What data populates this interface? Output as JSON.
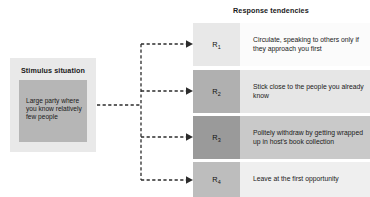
{
  "stimulus": {
    "title": "Stimulus situation",
    "situation_text": "Large party where you know relatively few people",
    "panel_color": "#e9e9e9",
    "inner_color": "#b6b6b6"
  },
  "responses": {
    "title": "Response tendencies",
    "items": [
      {
        "label": "R",
        "subscript": "1",
        "text": "Circulate, speaking to others only if they approach you first",
        "box_color": "#e8e8e8",
        "panel_color": "#fbfbfb"
      },
      {
        "label": "R",
        "subscript": "2",
        "text": "Stick close to the people you already know",
        "box_color": "#b0b0b0",
        "panel_color": "#e6e6e6"
      },
      {
        "label": "R",
        "subscript": "3",
        "text": "Politely withdraw by getting wrapped up in host's book collection",
        "box_color": "#9a9a9a",
        "panel_color": "#c9c9c9"
      },
      {
        "label": "R",
        "subscript": "4",
        "text": "Leave at the first opportunity",
        "box_color": "#bdbdbd",
        "panel_color": "#efefef"
      }
    ]
  },
  "connectors": {
    "line_color": "#2b2b2b",
    "style": "dashed",
    "arrow_count": 4
  }
}
